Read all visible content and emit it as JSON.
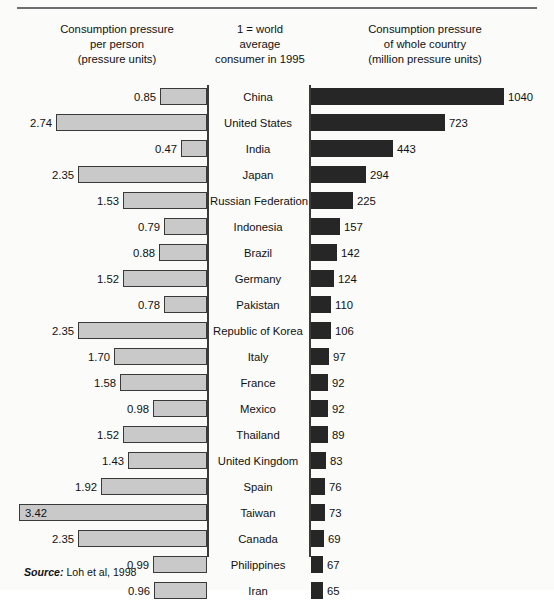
{
  "figure": {
    "source_label": "Source:",
    "source_text": "Loh et al, 1998"
  },
  "headers": {
    "left": "Consumption pressure\nper person\n(pressure units)",
    "left_lines": [
      "Consumption pressure",
      "per person",
      "(pressure units)"
    ],
    "middle_lines": [
      "1 = world",
      "average",
      "consumer in 1995"
    ],
    "right_lines": [
      "Consumption pressure",
      "of whole country",
      "(million pressure units)"
    ]
  },
  "colors": {
    "light_bar": "#c9c9c9",
    "dark_bar": "#262626",
    "axis": "#3a3a3a",
    "rule": "#6f6f72",
    "text": "#111111",
    "background": "#fbfbfa"
  },
  "chart_data": {
    "type": "bar",
    "orientation": "horizontal",
    "layout": "bidirectional-pyramid",
    "categories": [
      "China",
      "United States",
      "India",
      "Japan",
      "Russian Federation",
      "Indonesia",
      "Brazil",
      "Germany",
      "Pakistan",
      "Republic of Korea",
      "Italy",
      "France",
      "Mexico",
      "Thailand",
      "United Kingdom",
      "Spain",
      "Taiwan",
      "Canada",
      "Philippines",
      "Iran"
    ],
    "series": [
      {
        "name": "Consumption pressure per person (pressure units)",
        "side": "left",
        "units": "pressure units",
        "note": "1 = world average consumer in 1995",
        "max_axis": 3.42,
        "values": [
          0.85,
          2.74,
          0.47,
          2.35,
          1.53,
          0.79,
          0.88,
          1.52,
          0.78,
          2.35,
          1.7,
          1.58,
          0.98,
          1.52,
          1.43,
          1.92,
          3.42,
          2.35,
          0.99,
          0.96
        ],
        "labels": [
          "0.85",
          "2.74",
          "0.47",
          "2.35",
          "1.53",
          "0.79",
          "0.88",
          "1.52",
          "0.78",
          "2.35",
          "1.70",
          "1.58",
          "0.98",
          "1.52",
          "1.43",
          "1.92",
          "3.42",
          "2.35",
          "0.99",
          "0.96"
        ]
      },
      {
        "name": "Consumption pressure of whole country (million pressure units)",
        "side": "right",
        "units": "million pressure units",
        "max_axis": 1040,
        "values": [
          1040,
          723,
          443,
          294,
          225,
          157,
          142,
          124,
          110,
          106,
          97,
          92,
          92,
          89,
          83,
          76,
          73,
          69,
          67,
          65
        ],
        "labels": [
          "1040",
          "723",
          "443",
          "294",
          "225",
          "157",
          "142",
          "124",
          "110",
          "106",
          "97",
          "92",
          "92",
          "89",
          "83",
          "76",
          "73",
          "69",
          "67",
          "65"
        ]
      }
    ],
    "xlabel": "",
    "ylabel": "",
    "grid": false,
    "legend": false
  }
}
